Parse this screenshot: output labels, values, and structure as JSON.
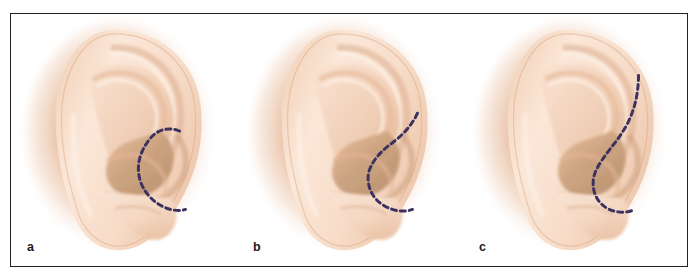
{
  "figure": {
    "kind": "anatomical-illustration",
    "border_color": "#241f1d",
    "background_color": "#ffffff",
    "panel_count": 3
  },
  "palette": {
    "skin_light": "#fbe6d6",
    "skin_mid": "#f3d2b8",
    "skin_shadow": "#e0b292",
    "skin_deep": "#c99a78",
    "concha_shadow": "#b49776",
    "halo_warm": "#e9c3a6",
    "dashed_line": "#3b3260",
    "label_text": "#1c1a19"
  },
  "panels": [
    {
      "id": "a",
      "label": "a",
      "ear_name": "ear-illustration-a",
      "marking": {
        "name": "dashed-incision-line-a",
        "description": "short C-shaped dashed line around the anterior rim of the concha",
        "color": "#3b3260",
        "dash_pattern": "5 4",
        "stroke_width": 3.0,
        "path": "M 169 118 C 157 113, 146 117, 139 126 C 130 137, 126 150, 128 162 C 130 176, 140 188, 152 194 C 160 198, 169 199, 175 197"
      }
    },
    {
      "id": "b",
      "label": "b",
      "ear_name": "ear-illustration-b",
      "marking": {
        "name": "dashed-incision-line-b",
        "description": "extended dashed line rising up to the helical root then curving down around the concha",
        "color": "#3b3260",
        "dash_pattern": "5 4",
        "stroke_width": 3.0,
        "path": "M 181 100 C 176 111, 168 120, 158 128 C 146 137, 136 146, 132 159 C 129 172, 135 186, 147 193 C 157 199, 168 200, 176 197"
      }
    },
    {
      "id": "c",
      "label": "c",
      "ear_name": "ear-illustration-c",
      "marking": {
        "name": "dashed-incision-line-c",
        "description": "long S-shaped dashed line from high on the helix sweeping down around the concha to the lobule",
        "color": "#3b3260",
        "dash_pattern": "5 4",
        "stroke_width": 3.0,
        "path": "M 176 62 C 176 80, 172 98, 163 114 C 153 131, 140 143, 133 158 C 127 172, 131 187, 143 195 C 153 201, 164 201, 172 197"
      }
    }
  ]
}
